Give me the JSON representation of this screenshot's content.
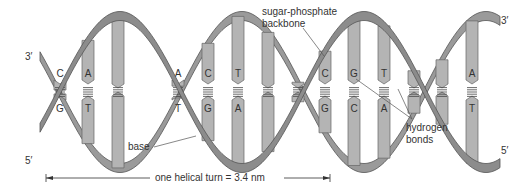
{
  "diagram": {
    "type": "dna-double-helix",
    "colors": {
      "backbone_fill": "#8c8c8c",
      "backbone_stroke": "#555555",
      "base_fill": "#b4b4b4",
      "base_stroke": "#666666",
      "bond_color": "#444444",
      "text": "#333333"
    },
    "end_labels": {
      "left_top": "3′",
      "left_bottom": "5′",
      "right_top": "3′",
      "right_bottom": "5′"
    },
    "annotations": {
      "backbone_line1": "sugar-phosphate",
      "backbone_line2": "backbone",
      "hydrogen_line1": "hydrogen",
      "hydrogen_line2": "bonds",
      "base": "base"
    },
    "scale": {
      "label": "one helical turn = 3.4 nm"
    },
    "base_pairs": [
      {
        "x": 60,
        "top": "C",
        "bottom": "G",
        "visible": true
      },
      {
        "x": 88,
        "top": "A",
        "bottom": "T",
        "visible": true
      },
      {
        "x": 118,
        "top": "",
        "bottom": "",
        "visible": false
      },
      {
        "x": 178,
        "top": "A",
        "bottom": "T",
        "visible": true
      },
      {
        "x": 208,
        "top": "C",
        "bottom": "G",
        "visible": true
      },
      {
        "x": 238,
        "top": "T",
        "bottom": "A",
        "visible": true
      },
      {
        "x": 268,
        "top": "",
        "bottom": "",
        "visible": false
      },
      {
        "x": 298,
        "top": "",
        "bottom": "",
        "visible": false
      },
      {
        "x": 325,
        "top": "C",
        "bottom": "G",
        "visible": true
      },
      {
        "x": 354,
        "top": "G",
        "bottom": "C",
        "visible": true
      },
      {
        "x": 384,
        "top": "T",
        "bottom": "A",
        "visible": true
      },
      {
        "x": 414,
        "top": "",
        "bottom": "",
        "visible": false
      },
      {
        "x": 442,
        "top": "",
        "bottom": "",
        "visible": false
      },
      {
        "x": 472,
        "top": "A",
        "bottom": "T",
        "visible": true
      }
    ]
  }
}
